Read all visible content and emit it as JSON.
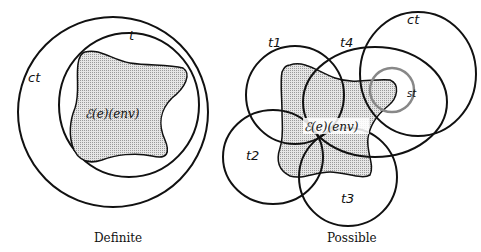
{
  "definite": {
    "caption": "Definite",
    "labels": {
      "outer": "ct",
      "inner": "t",
      "region": "ℰ(e)(env)"
    }
  },
  "possible": {
    "caption": "Possible",
    "labels": {
      "ct": "ct",
      "t1": "t1",
      "t2": "t2",
      "t3": "t3",
      "t4": "t4",
      "st": "st",
      "region": "ℰ(e)(env)"
    }
  },
  "colors": {
    "stroke": "#111111",
    "st_stroke": "#888888",
    "region_fill": "#d9d9d9"
  }
}
